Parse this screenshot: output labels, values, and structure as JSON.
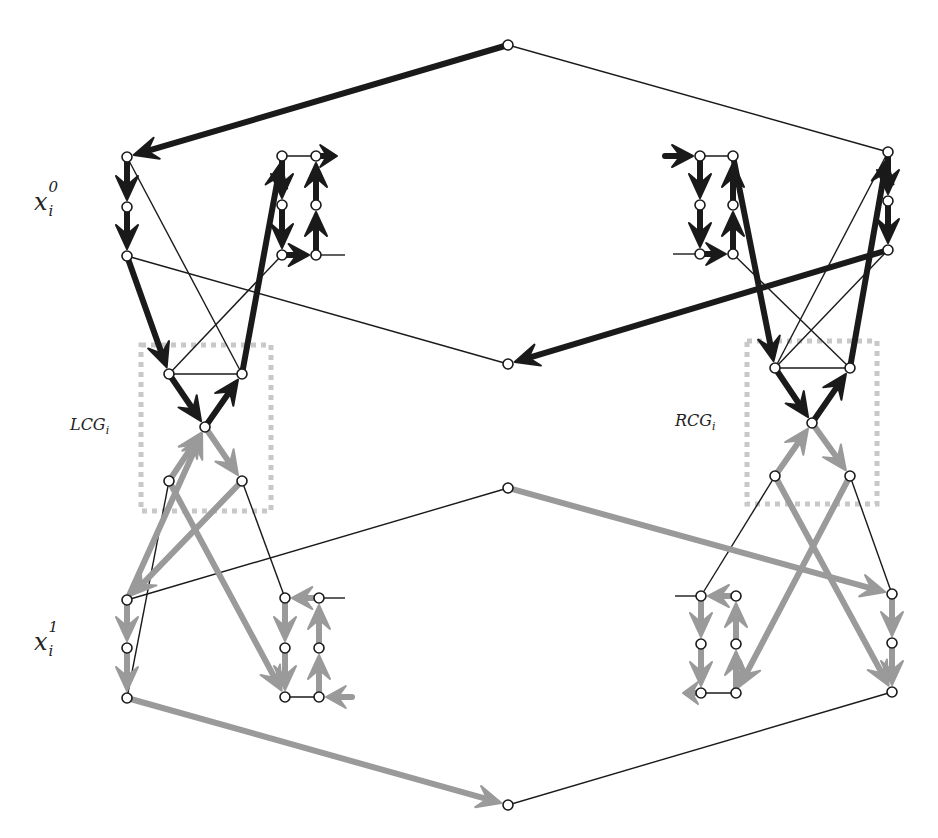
{
  "labels": {
    "x0": {
      "base": "x",
      "sup": "0",
      "sub": "i"
    },
    "x1": {
      "base": "x",
      "sup": "1",
      "sub": "i"
    },
    "lcg": {
      "base": "LCG",
      "sub": "i"
    },
    "rcg": {
      "base": "RCG",
      "sub": "i"
    }
  },
  "colors": {
    "dark": "#1a1a1a",
    "gray": "#9a9a9a",
    "thin": "#1a1a1a",
    "box": "#c8c8c8",
    "node_fill": "#ffffff",
    "node_stroke": "#1a1a1a"
  },
  "nodes": {
    "top": [
      508,
      45
    ],
    "mid_upper": [
      508,
      364
    ],
    "mid_lower": [
      508,
      488
    ],
    "bottom": [
      508,
      805
    ],
    "L_a0": [
      127,
      157
    ],
    "L_a1": [
      127,
      207
    ],
    "L_a2": [
      127,
      256
    ],
    "L_b0": [
      282,
      156
    ],
    "L_b1": [
      282,
      205
    ],
    "L_b2": [
      282,
      255
    ],
    "L_c0": [
      316,
      156
    ],
    "L_c1": [
      316,
      205
    ],
    "L_c2": [
      316,
      255
    ],
    "L_g_tl": [
      169,
      374
    ],
    "L_g_tr": [
      242,
      374
    ],
    "L_g_c": [
      205,
      427
    ],
    "L_g_bl": [
      169,
      481
    ],
    "L_g_br": [
      242,
      481
    ],
    "L_d0": [
      127,
      600
    ],
    "L_d1": [
      127,
      648
    ],
    "L_d2": [
      127,
      698
    ],
    "L_e0": [
      285,
      598
    ],
    "L_e1": [
      285,
      648
    ],
    "L_e2": [
      285,
      697
    ],
    "L_f0": [
      319,
      598
    ],
    "L_f1": [
      319,
      648
    ],
    "L_f2": [
      319,
      697
    ],
    "R_a0": [
      700,
      156
    ],
    "R_a1": [
      700,
      205
    ],
    "R_a2": [
      700,
      254
    ],
    "R_b0": [
      733,
      156
    ],
    "R_b1": [
      733,
      205
    ],
    "R_b2": [
      733,
      254
    ],
    "R_c0": [
      888,
      152
    ],
    "R_c1": [
      888,
      201
    ],
    "R_c2": [
      888,
      250
    ],
    "R_g_tl": [
      775,
      368
    ],
    "R_g_tr": [
      850,
      368
    ],
    "R_g_c": [
      812,
      423
    ],
    "R_g_bl": [
      775,
      476
    ],
    "R_g_br": [
      850,
      476
    ],
    "R_d0": [
      701,
      596
    ],
    "R_d1": [
      701,
      644
    ],
    "R_d2": [
      701,
      693
    ],
    "R_e0": [
      736,
      596
    ],
    "R_e1": [
      736,
      644
    ],
    "R_e2": [
      736,
      693
    ],
    "R_f0": [
      892,
      594
    ],
    "R_f1": [
      892,
      643
    ],
    "R_f2": [
      892,
      692
    ]
  },
  "thin_edges": [
    [
      "top",
      "R_c0"
    ],
    [
      "L_a0",
      "L_g_tr"
    ],
    [
      "L_a2",
      "mid_upper"
    ],
    [
      "L_g_tl",
      "L_b2"
    ],
    [
      "L_b0",
      "L_c0"
    ],
    [
      "L_c2",
      [
        345,
        255
      ]
    ],
    [
      "R_c0",
      "R_g_tl"
    ],
    [
      "R_c2",
      "R_g_tl"
    ],
    [
      "R_g_tr",
      "R_b2"
    ],
    [
      "R_a2",
      [
        673,
        254
      ]
    ],
    [
      "R_a0",
      "R_b0"
    ],
    [
      "L_g_tl",
      "L_g_tr"
    ],
    [
      "R_g_tl",
      "R_g_tr"
    ],
    [
      "L_g_bl",
      "L_d2"
    ],
    [
      "L_g_br",
      "L_e0"
    ],
    [
      "mid_lower",
      "L_d0"
    ],
    [
      "L_e2",
      "L_f2"
    ],
    [
      "L_f0",
      [
        345,
        598
      ]
    ],
    [
      "R_g_bl",
      "R_d0"
    ],
    [
      "R_g_br",
      "R_f0"
    ],
    [
      "bottom",
      "R_f2"
    ],
    [
      "R_d2",
      "R_e2"
    ],
    [
      "R_d0",
      [
        675,
        596
      ]
    ]
  ],
  "dark_arrows": [
    [
      [
        508,
        45
      ],
      [
        127,
        157
      ]
    ],
    [
      [
        127,
        157
      ],
      [
        127,
        207
      ]
    ],
    [
      [
        127,
        207
      ],
      [
        127,
        256
      ]
    ],
    [
      [
        127,
        256
      ],
      [
        169,
        374
      ]
    ],
    [
      [
        169,
        374
      ],
      [
        205,
        427
      ]
    ],
    [
      [
        205,
        427
      ],
      [
        242,
        374
      ]
    ],
    [
      [
        242,
        374
      ],
      [
        282,
        156
      ]
    ],
    [
      [
        282,
        156
      ],
      [
        282,
        205
      ]
    ],
    [
      [
        282,
        205
      ],
      [
        282,
        255
      ]
    ],
    [
      [
        282,
        255
      ],
      [
        316,
        255
      ]
    ],
    [
      [
        316,
        255
      ],
      [
        316,
        205
      ]
    ],
    [
      [
        316,
        205
      ],
      [
        316,
        156
      ]
    ],
    [
      [
        316,
        156
      ],
      [
        344,
        156
      ]
    ],
    [
      [
        888,
        250
      ],
      [
        508,
        364
      ]
    ],
    [
      [
        888,
        152
      ],
      [
        888,
        201
      ]
    ],
    [
      [
        888,
        201
      ],
      [
        888,
        250
      ]
    ],
    [
      [
        812,
        423
      ],
      [
        850,
        368
      ]
    ],
    [
      [
        850,
        368
      ],
      [
        888,
        152
      ]
    ],
    [
      [
        733,
        156
      ],
      [
        775,
        368
      ]
    ],
    [
      [
        775,
        368
      ],
      [
        812,
        423
      ]
    ],
    [
      [
        733,
        254
      ],
      [
        733,
        205
      ]
    ],
    [
      [
        733,
        205
      ],
      [
        733,
        156
      ]
    ],
    [
      [
        700,
        254
      ],
      [
        733,
        254
      ]
    ],
    [
      [
        700,
        205
      ],
      [
        700,
        254
      ]
    ],
    [
      [
        700,
        156
      ],
      [
        700,
        205
      ]
    ],
    [
      [
        665,
        156
      ],
      [
        700,
        156
      ]
    ]
  ],
  "gray_arrows": [
    [
      [
        127,
        698
      ],
      [
        508,
        805
      ]
    ],
    [
      [
        127,
        600
      ],
      [
        127,
        648
      ]
    ],
    [
      [
        127,
        648
      ],
      [
        127,
        698
      ]
    ],
    [
      [
        127,
        600
      ],
      [
        205,
        427
      ]
    ],
    [
      [
        169,
        481
      ],
      [
        205,
        427
      ]
    ],
    [
      [
        205,
        427
      ],
      [
        242,
        481
      ]
    ],
    [
      [
        242,
        481
      ],
      [
        127,
        600
      ]
    ],
    [
      [
        169,
        481
      ],
      [
        285,
        697
      ]
    ],
    [
      [
        285,
        598
      ],
      [
        285,
        648
      ]
    ],
    [
      [
        285,
        648
      ],
      [
        285,
        697
      ]
    ],
    [
      [
        319,
        598
      ],
      [
        285,
        598
      ]
    ],
    [
      [
        319,
        697
      ],
      [
        319,
        648
      ]
    ],
    [
      [
        319,
        648
      ],
      [
        319,
        598
      ]
    ],
    [
      [
        352,
        697
      ],
      [
        319,
        697
      ]
    ],
    [
      [
        508,
        488
      ],
      [
        892,
        594
      ]
    ],
    [
      [
        892,
        594
      ],
      [
        892,
        643
      ]
    ],
    [
      [
        892,
        643
      ],
      [
        892,
        692
      ]
    ],
    [
      [
        775,
        476
      ],
      [
        892,
        692
      ]
    ],
    [
      [
        775,
        476
      ],
      [
        812,
        423
      ]
    ],
    [
      [
        812,
        423
      ],
      [
        850,
        476
      ]
    ],
    [
      [
        850,
        476
      ],
      [
        736,
        693
      ]
    ],
    [
      [
        736,
        596
      ],
      [
        701,
        596
      ]
    ],
    [
      [
        701,
        596
      ],
      [
        701,
        644
      ]
    ],
    [
      [
        701,
        644
      ],
      [
        701,
        693
      ]
    ],
    [
      [
        701,
        693
      ],
      [
        676,
        693
      ]
    ],
    [
      [
        736,
        693
      ],
      [
        736,
        644
      ]
    ],
    [
      [
        736,
        644
      ],
      [
        736,
        596
      ]
    ]
  ],
  "boxes": [
    {
      "name": "lcg-box",
      "x": 141,
      "y": 345,
      "w": 130,
      "h": 166
    },
    {
      "name": "rcg-box",
      "x": 747,
      "y": 341,
      "w": 130,
      "h": 163
    }
  ]
}
